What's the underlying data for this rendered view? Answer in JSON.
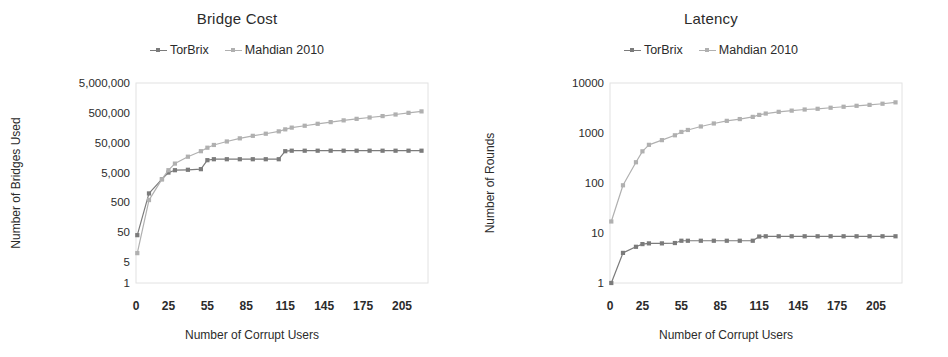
{
  "figure": {
    "width": 948,
    "height": 357,
    "background": "#ffffff"
  },
  "colors": {
    "torbrix": "#7b7b7b",
    "mahdian": "#b0b0b0",
    "text": "#2b2b2b",
    "frame": "#e2e2e2"
  },
  "panels": [
    {
      "id": "bridge-cost",
      "title": "Bridge Cost",
      "legend": [
        {
          "label": "TorBrix",
          "color": "#7b7b7b"
        },
        {
          "label": "Mahdian 2010",
          "color": "#b0b0b0"
        }
      ],
      "xlabel": "Number of Corrupt Users",
      "ylabel": "Number of Bridges Used"
    },
    {
      "id": "latency",
      "title": "Latency",
      "legend": [
        {
          "label": "TorBrix",
          "color": "#7b7b7b"
        },
        {
          "label": "Mahdian 2010",
          "color": "#b0b0b0"
        }
      ],
      "xlabel": "Number of Corrupt Users",
      "ylabel": "Number of Rounds"
    }
  ],
  "chart_data": [
    {
      "type": "line",
      "id": "bridge-cost",
      "title": "Bridge Cost",
      "xlabel": "Number of Corrupt Users",
      "ylabel": "Number of Bridges Used",
      "yscale": "log",
      "ylim": [
        1,
        5000000
      ],
      "xlim": [
        0,
        225
      ],
      "grid": false,
      "legend_position": "top-center",
      "yticks": [
        1,
        5,
        50,
        500,
        5000,
        50000,
        500000,
        5000000
      ],
      "ytick_labels": [
        "1",
        "5",
        "50",
        "500",
        "5,000",
        "50,000",
        "500,000",
        "5,000,000"
      ],
      "xticks": [
        0,
        25,
        55,
        85,
        115,
        145,
        175,
        205
      ],
      "xtick_labels": [
        "0",
        "25",
        "55",
        "85",
        "115",
        "145",
        "175",
        "205"
      ],
      "x": [
        1,
        10,
        20,
        25,
        30,
        40,
        50,
        55,
        60,
        70,
        80,
        90,
        100,
        110,
        115,
        120,
        130,
        140,
        150,
        160,
        170,
        180,
        190,
        200,
        210,
        220
      ],
      "series": [
        {
          "name": "TorBrix",
          "color": "#7b7b7b",
          "values": [
            40,
            1000,
            3000,
            5000,
            6000,
            6200,
            6500,
            13000,
            14000,
            14000,
            14000,
            14000,
            14000,
            14000,
            26000,
            27000,
            27000,
            27000,
            27000,
            27000,
            27000,
            27000,
            27000,
            27000,
            27000,
            27000
          ]
        },
        {
          "name": "Mahdian 2010",
          "color": "#b0b0b0",
          "values": [
            10,
            600,
            3000,
            6000,
            10000,
            17000,
            26000,
            34000,
            42000,
            55000,
            70000,
            85000,
            100000,
            120000,
            140000,
            160000,
            185000,
            215000,
            245000,
            280000,
            315000,
            350000,
            390000,
            440000,
            500000,
            560000
          ]
        }
      ]
    },
    {
      "type": "line",
      "id": "latency",
      "title": "Latency",
      "xlabel": "Number of Corrupt Users",
      "ylabel": "Number of Rounds",
      "yscale": "log",
      "ylim": [
        1,
        10000
      ],
      "xlim": [
        0,
        225
      ],
      "grid": false,
      "legend_position": "top-center",
      "yticks": [
        1,
        10,
        100,
        1000,
        10000
      ],
      "ytick_labels": [
        "1",
        "10",
        "100",
        "1000",
        "10000"
      ],
      "xticks": [
        0,
        25,
        55,
        85,
        115,
        145,
        175,
        205
      ],
      "xtick_labels": [
        "0",
        "25",
        "55",
        "85",
        "115",
        "145",
        "175",
        "205"
      ],
      "x": [
        1,
        10,
        20,
        25,
        30,
        40,
        50,
        55,
        60,
        70,
        80,
        90,
        100,
        110,
        115,
        120,
        130,
        140,
        150,
        160,
        170,
        180,
        190,
        200,
        210,
        220
      ],
      "series": [
        {
          "name": "TorBrix",
          "color": "#7b7b7b",
          "values": [
            1,
            4,
            5.3,
            6,
            6.2,
            6.2,
            6.3,
            7,
            7,
            7,
            7,
            7,
            7,
            7,
            8.5,
            8.6,
            8.6,
            8.6,
            8.6,
            8.6,
            8.6,
            8.6,
            8.6,
            8.6,
            8.6,
            8.6
          ]
        },
        {
          "name": "Mahdian 2010",
          "color": "#b0b0b0",
          "values": [
            17,
            90,
            260,
            430,
            580,
            720,
            900,
            1050,
            1150,
            1350,
            1550,
            1750,
            1900,
            2100,
            2300,
            2450,
            2650,
            2800,
            2950,
            3050,
            3200,
            3350,
            3500,
            3650,
            3850,
            4100
          ]
        }
      ]
    }
  ]
}
